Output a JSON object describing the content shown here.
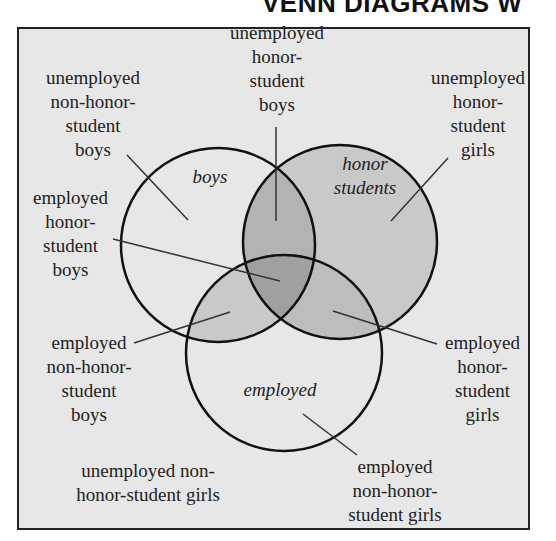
{
  "header": {
    "title": "VENN DIAGRAMS W"
  },
  "diagram": {
    "sets": {
      "boys": "boys",
      "honor": "honor\nstudents",
      "employed": "employed"
    },
    "regions": {
      "unemployed_non_honor_boys": "unemployed\nnon-honor-\nstudent\nboys",
      "unemployed_honor_boys": "unemployed\nhonor-\nstudent\nboys",
      "unemployed_honor_girls": "unemployed\nhonor-\nstudent\ngirls",
      "employed_honor_boys": "employed\nhonor-\nstudent\nboys",
      "employed_non_honor_boys": "employed\nnon-honor-\nstudent\nboys",
      "employed_honor_girls": "employed\nhonor-\nstudent\ngirls",
      "unemployed_non_honor_girls": "unemployed non-\nhonor-student girls",
      "employed_non_honor_girls": "employed\nnon-honor-\nstudent girls"
    },
    "colors": {
      "background": "#e7e7e7",
      "one_overlap": "#c9c9c9",
      "two_overlap": "#b3b3b3",
      "three_overlap": "#a0a0a0",
      "stroke": "#111111"
    }
  }
}
